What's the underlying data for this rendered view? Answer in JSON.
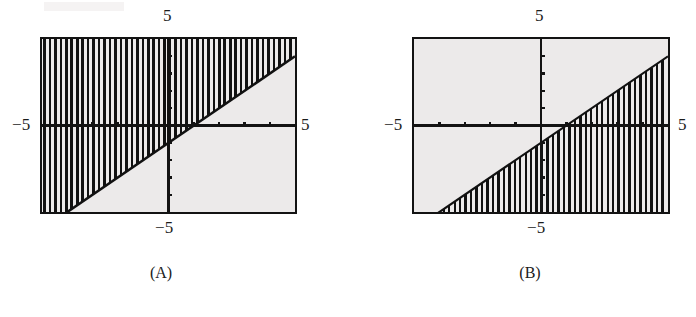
{
  "figure": {
    "panels": [
      {
        "id": "A",
        "caption": "(A)",
        "labels": {
          "top": "5",
          "left": "−5",
          "right": "5",
          "bottom": "−5"
        }
      },
      {
        "id": "B",
        "caption": "(B)",
        "labels": {
          "top": "5",
          "left": "−5",
          "right": "5",
          "bottom": "−5"
        }
      }
    ]
  },
  "chart_data": [
    {
      "type": "line",
      "title": "(A)",
      "xlabel": "",
      "ylabel": "",
      "xlim": [
        -5,
        5
      ],
      "ylim": [
        -5,
        5
      ],
      "xticks": [
        -5,
        -4,
        -3,
        -2,
        -1,
        0,
        1,
        2,
        3,
        4,
        5
      ],
      "xtick_labels": [
        "−5",
        "",
        "",
        "",
        "",
        "",
        "",
        "",
        "",
        "",
        "5"
      ],
      "yticks": [
        -5,
        -4,
        -3,
        -2,
        -1,
        0,
        1,
        2,
        3,
        4,
        5
      ],
      "ytick_labels": [
        "−5",
        "",
        "",
        "",
        "",
        "",
        "",
        "",
        "",
        "",
        "5"
      ],
      "grid": false,
      "legend": null,
      "boundary_line": {
        "name": "y = x - 1",
        "slope": 1,
        "intercept": -1,
        "style": "solid",
        "x": [
          -5,
          5
        ],
        "y": [
          -6,
          4
        ]
      },
      "shaded_region": {
        "description": "vertical hatch fill above the boundary line",
        "inequality": "y ≥ x − 1",
        "side": "above",
        "hatch": "vertical",
        "hatch_spacing_px": 5.5,
        "color": "#111111"
      },
      "background": "#eceaea",
      "axis_color": "#131313"
    },
    {
      "type": "line",
      "title": "(B)",
      "xlabel": "",
      "ylabel": "",
      "xlim": [
        -5,
        5
      ],
      "ylim": [
        -5,
        5
      ],
      "xticks": [
        -5,
        -4,
        -3,
        -2,
        -1,
        0,
        1,
        2,
        3,
        4,
        5
      ],
      "xtick_labels": [
        "−5",
        "",
        "",
        "",
        "",
        "",
        "",
        "",
        "",
        "",
        "5"
      ],
      "yticks": [
        -5,
        -4,
        -3,
        -2,
        -1,
        0,
        1,
        2,
        3,
        4,
        5
      ],
      "ytick_labels": [
        "−5",
        "",
        "",
        "",
        "",
        "",
        "",
        "",
        "",
        "",
        "5"
      ],
      "grid": false,
      "legend": null,
      "boundary_line": {
        "name": "y = x - 1",
        "slope": 1,
        "intercept": -1,
        "style": "solid",
        "x": [
          -5,
          5
        ],
        "y": [
          -6,
          4
        ]
      },
      "shaded_region": {
        "description": "vertical hatch fill below the boundary line",
        "inequality": "y ≤ x − 1",
        "side": "below",
        "hatch": "vertical",
        "hatch_spacing_px": 5.5,
        "color": "#111111"
      },
      "background": "#eceaea",
      "axis_color": "#131313"
    }
  ]
}
